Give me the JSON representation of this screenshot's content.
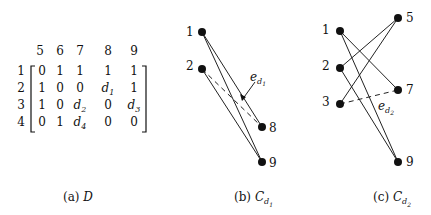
{
  "matrix": {
    "name": "D",
    "col_headers": [
      "5",
      "6",
      "7",
      "8",
      "9"
    ],
    "row_headers": [
      "1",
      "2",
      "3",
      "4"
    ],
    "rows": [
      [
        "0",
        "1",
        "1",
        "1",
        "1"
      ],
      [
        "1",
        "0",
        "0",
        "d1",
        "1"
      ],
      [
        "1",
        "0",
        "d2",
        "0",
        "d3"
      ],
      [
        "0",
        "1",
        "d4",
        "0",
        "0"
      ]
    ]
  },
  "graph_b": {
    "left_nodes": [
      "1",
      "2"
    ],
    "right_nodes": [
      "8",
      "9"
    ],
    "edges": [
      [
        "1",
        "8"
      ],
      [
        "1",
        "9"
      ],
      [
        "2",
        "9"
      ]
    ],
    "dashed_edges": [
      [
        "2",
        "8"
      ]
    ],
    "annotation": "e_d1"
  },
  "graph_c": {
    "left_nodes": [
      "1",
      "2",
      "3"
    ],
    "right_nodes": [
      "5",
      "7",
      "9"
    ],
    "edges": [
      [
        "1",
        "7"
      ],
      [
        "1",
        "9"
      ],
      [
        "2",
        "5"
      ],
      [
        "2",
        "9"
      ],
      [
        "3",
        "5"
      ]
    ],
    "dashed_edges": [
      [
        "3",
        "7"
      ]
    ],
    "annotation": "e_d2"
  },
  "captions": {
    "a_prefix": "(a)",
    "a_symbol": "D",
    "b_prefix": "(b)",
    "b_symbol": "C",
    "b_sub": "d",
    "b_subsub": "1",
    "c_prefix": "(c)",
    "c_symbol": "C",
    "c_sub": "d",
    "c_subsub": "2"
  },
  "labels": {
    "b_annot_e": "e",
    "b_annot_d": "d",
    "b_annot_n": "1",
    "c_annot_e": "e",
    "c_annot_d": "d",
    "c_annot_n": "2"
  }
}
